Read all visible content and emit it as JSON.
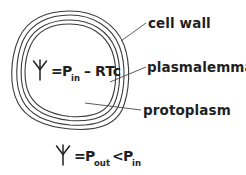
{
  "figure": {
    "background_color": "#ffffff",
    "ink_color": "#221f1f",
    "outline_color": "#3a3a3a"
  },
  "labels": {
    "cell_wall": "cell wall",
    "plasmalemma": "plasmalemma",
    "protoplasm": "protoplasm"
  },
  "formulas": {
    "inner": {
      "psi": "Ψ",
      "equals": "=",
      "p_symbol": "P",
      "p_subscript": "in",
      "minus": "–",
      "term": "RTc",
      "full_text": "Ψ = P_in – RTc"
    },
    "bottom": {
      "psi": "Ψ",
      "equals": "=",
      "p_out_symbol": "P",
      "p_out_subscript": "out",
      "less_than": "<",
      "p_in_symbol": "P",
      "p_in_subscript": "in",
      "full_text": "Ψ = P_out < P_in"
    }
  },
  "structures": [
    {
      "name": "cell-wall",
      "label": "cell wall"
    },
    {
      "name": "plasmalemma",
      "label": "plasmalemma"
    },
    {
      "name": "protoplasm",
      "label": "protoplasm"
    }
  ]
}
